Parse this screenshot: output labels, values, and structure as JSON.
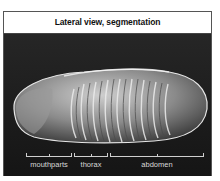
{
  "figure": {
    "title": "Lateral view, segmentation",
    "segments": [
      {
        "label": "mouthparts"
      },
      {
        "label": "thorax"
      },
      {
        "label": "abdomen"
      }
    ]
  }
}
